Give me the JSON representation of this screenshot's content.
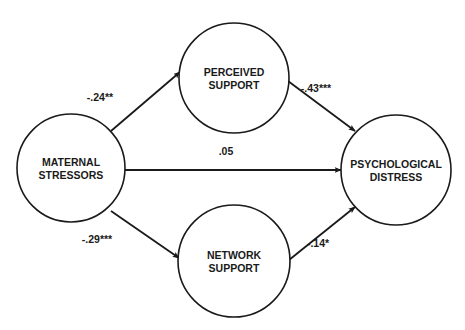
{
  "diagram": {
    "type": "path-model",
    "nodes": [
      {
        "id": "maternal",
        "label_lines": [
          "MATERNAL",
          "STRESSORS"
        ],
        "cx": 71,
        "cy": 168,
        "r": 54
      },
      {
        "id": "perceived",
        "label_lines": [
          "PERCEIVED",
          "SUPPORT"
        ],
        "cx": 234,
        "cy": 78,
        "r": 55
      },
      {
        "id": "network",
        "label_lines": [
          "NETWORK",
          "SUPPORT"
        ],
        "cx": 234,
        "cy": 261,
        "r": 56
      },
      {
        "id": "distress",
        "label_lines": [
          "PSYCHOLOGICAL",
          "DISTRESS"
        ],
        "cx": 396,
        "cy": 170,
        "r": 55
      }
    ],
    "edges": [
      {
        "from": "maternal",
        "to": "perceived",
        "coefficient": "-.24**",
        "x1": 111,
        "y1": 131,
        "x2": 180,
        "y2": 72,
        "lx": 100,
        "ly": 101
      },
      {
        "from": "perceived",
        "to": "distress",
        "coefficient": "-.43***",
        "x1": 288,
        "y1": 81,
        "x2": 355,
        "y2": 131,
        "lx": 316,
        "ly": 92
      },
      {
        "from": "maternal",
        "to": "distress",
        "coefficient": ".05",
        "x1": 125,
        "y1": 170,
        "x2": 341,
        "y2": 170,
        "lx": 226,
        "ly": 155
      },
      {
        "from": "maternal",
        "to": "network",
        "coefficient": "-.29***",
        "x1": 111,
        "y1": 211,
        "x2": 179,
        "y2": 258,
        "lx": 97,
        "ly": 243
      },
      {
        "from": "network",
        "to": "distress",
        "coefficient": "-.14*",
        "x1": 289,
        "y1": 260,
        "x2": 355,
        "y2": 207,
        "lx": 318,
        "ly": 247
      }
    ],
    "colors": {
      "stroke": "#1a1a1a",
      "background": "#ffffff"
    }
  }
}
